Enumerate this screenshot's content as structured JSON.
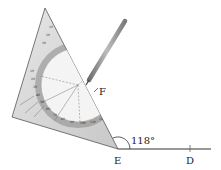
{
  "diagram": {
    "points": {
      "E": {
        "label": "E",
        "x": 118,
        "y": 149
      },
      "D": {
        "label": "D",
        "x": 190,
        "y": 149
      },
      "F": {
        "label": "F",
        "x": 94,
        "y": 90
      }
    },
    "angle": {
      "vertex": "E",
      "label": "118°",
      "value_degrees": 118
    },
    "ray": {
      "from": "E",
      "through": "D"
    },
    "tools": [
      "set-square-protractor",
      "pencil"
    ],
    "colors": {
      "line": "#333333",
      "triangle_fill": "#d9d9d9",
      "protractor_fill": "#f2f2f2",
      "pencil": "#8a8a8a"
    }
  }
}
